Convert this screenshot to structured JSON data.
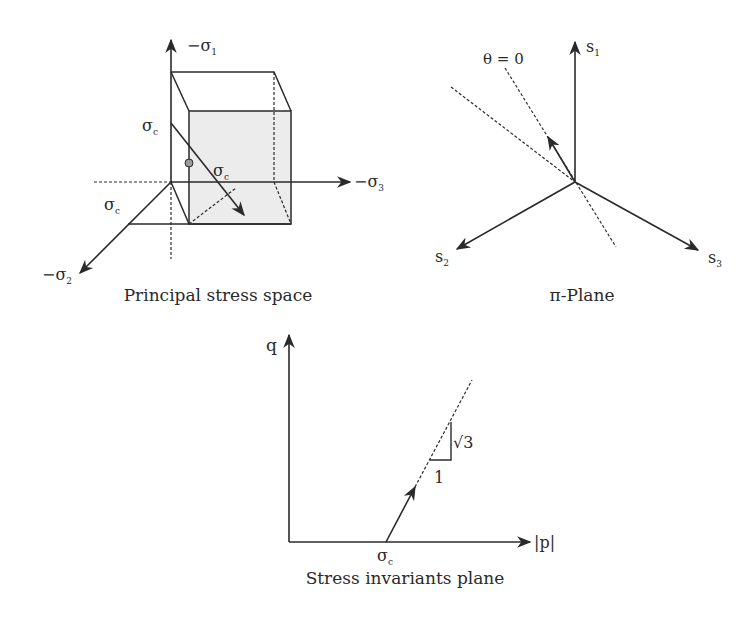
{
  "colors": {
    "stroke": "#2a2a2a",
    "shade": "#ececec",
    "point": "#9a9a9a"
  },
  "panels": {
    "principal": {
      "caption": "Principal stress space",
      "axis1": {
        "prefix": "−σ",
        "sub": "1"
      },
      "axis2": {
        "prefix": "−σ",
        "sub": "2"
      },
      "axis3": {
        "prefix": "−σ",
        "sub": "3"
      },
      "sc_vertical": {
        "main": "σ",
        "sub": "c"
      },
      "sc_diag": {
        "main": "σ",
        "sub": "c"
      },
      "sc_left": {
        "main": "σ",
        "sub": "c"
      }
    },
    "pi_plane": {
      "caption": "π-Plane",
      "theta_label": "θ = 0",
      "s1": {
        "main": "s",
        "sub": "1"
      },
      "s2": {
        "main": "s",
        "sub": "2"
      },
      "s3": {
        "main": "s",
        "sub": "3"
      }
    },
    "invariants": {
      "caption": "Stress invariants plane",
      "y_axis": "q",
      "x_axis": "|p|",
      "origin_label": {
        "main": "σ",
        "sub": "c"
      },
      "slope_rise": "√3",
      "slope_run": "1"
    }
  }
}
